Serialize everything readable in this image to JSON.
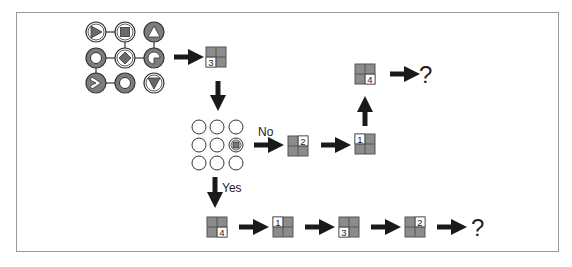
{
  "colors": {
    "frame": "#9a9a9a",
    "ink": "#1a1a1a",
    "tile_fill": "#8c8c8c",
    "tile_line": "#555555",
    "dark_circle": "#7d7d7d",
    "white": "#ffffff"
  },
  "symbol_grid": {
    "cells": [
      {
        "row": 0,
        "col": 0,
        "style": "light",
        "glyph": "triangle-right"
      },
      {
        "row": 0,
        "col": 1,
        "style": "light",
        "glyph": "square"
      },
      {
        "row": 0,
        "col": 2,
        "style": "dark",
        "glyph": "triangle-up"
      },
      {
        "row": 1,
        "col": 0,
        "style": "dark",
        "glyph": "ring"
      },
      {
        "row": 1,
        "col": 1,
        "style": "light",
        "glyph": "diamond"
      },
      {
        "row": 1,
        "col": 2,
        "style": "dark",
        "glyph": "notched-circle"
      },
      {
        "row": 2,
        "col": 0,
        "style": "dark",
        "glyph": "chevron-right"
      },
      {
        "row": 2,
        "col": 1,
        "style": "dark",
        "glyph": "ring"
      },
      {
        "row": 2,
        "col": 2,
        "style": "light",
        "glyph": "triangle-down"
      }
    ],
    "links": [
      [
        [
          0,
          0
        ],
        [
          0,
          1
        ]
      ],
      [
        [
          0,
          1
        ],
        [
          1,
          1
        ]
      ],
      [
        [
          0,
          2
        ],
        [
          1,
          2
        ]
      ],
      [
        [
          1,
          0
        ],
        [
          1,
          1
        ]
      ],
      [
        [
          1,
          1
        ],
        [
          1,
          2
        ]
      ],
      [
        [
          1,
          0
        ],
        [
          2,
          0
        ]
      ],
      [
        [
          2,
          0
        ],
        [
          2,
          1
        ]
      ]
    ]
  },
  "tiles": {
    "start": {
      "number": "3",
      "quadrant": "bottom-left"
    },
    "no_branch": [
      {
        "number": "2",
        "quadrant": "top-right"
      },
      {
        "number": "1",
        "quadrant": "top-left"
      },
      {
        "number": "4",
        "quadrant": "bottom-right"
      }
    ],
    "yes_branch": [
      {
        "number": "4",
        "quadrant": "bottom-right"
      },
      {
        "number": "1",
        "quadrant": "top-left"
      },
      {
        "number": "3",
        "quadrant": "bottom-left"
      },
      {
        "number": "2",
        "quadrant": "top-right"
      }
    ]
  },
  "dot_grid": {
    "rows": 3,
    "cols": 3,
    "marked_cell": {
      "row": 1,
      "col": 2
    }
  },
  "labels": {
    "no": "No",
    "yes": "Yes",
    "unknown_top": "?",
    "unknown_bottom": "?"
  }
}
